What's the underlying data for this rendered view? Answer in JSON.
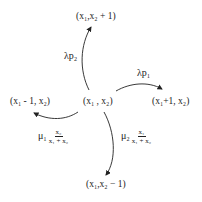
{
  "diagram": {
    "type": "state-transition",
    "center_node": "(x₁, x₂)",
    "nodes": {
      "up": "(x₁,x₂ + 1)",
      "right": "(x₁+1, x₂)",
      "left": "(x₁ - 1, x₂)",
      "down": "(x₁,x₂ − 1)",
      "center": "(x₁ , x₂)"
    },
    "transitions": {
      "up": {
        "rate": "λp₂"
      },
      "right": {
        "rate": "λp₁"
      },
      "left": {
        "coef": "μ₁",
        "num": "x₂",
        "den": "x₁ + x₂"
      },
      "down": {
        "coef": "μ₂",
        "num": "x₁",
        "den": "x₁ + x₂"
      }
    },
    "colors": {
      "ink": "#222222",
      "background": "#ffffff"
    }
  }
}
